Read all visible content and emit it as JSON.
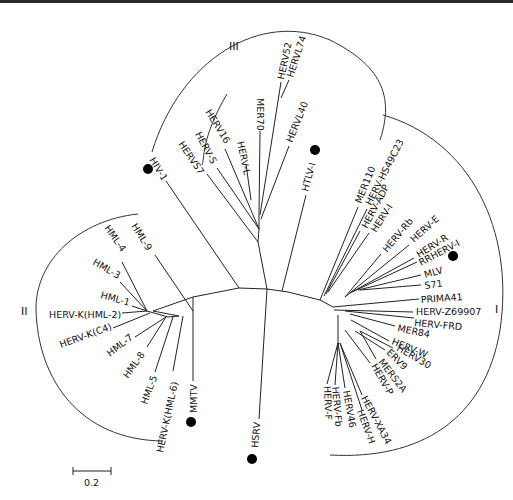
{
  "figure": {
    "type": "unrooted phylogenetic tree",
    "scale_bar": {
      "label": "0.2"
    },
    "clades": [
      {
        "id": "I",
        "label": "I"
      },
      {
        "id": "II",
        "label": "II"
      },
      {
        "id": "III",
        "label": "III"
      }
    ],
    "taxa": {
      "clade_III": [
        "HERV52",
        "HERVL74",
        "MER70",
        "HERVL40",
        "HERV16",
        "HERV-S",
        "HERV-L",
        "HERVS7"
      ],
      "clade_I": [
        "MER110",
        "HERV-HS49C23",
        "HERV-ADP",
        "HERV-I",
        "HERV-Rb",
        "HERV-E",
        "HERV-R",
        "RRHERV-I",
        "MLV",
        "S71",
        "PRIMA41",
        "HERV-Z69907",
        "HERV-FRD",
        "MER84",
        "HERV-W",
        "HERV30",
        "ERV9",
        "MERS2A",
        "HERV-P",
        "HERV-XA34",
        "HERV-H",
        "HERV46",
        "HERV-Fb",
        "HERV-F"
      ],
      "clade_II": [
        "HML-9",
        "HML-4",
        "HML-3",
        "HML-1",
        "HERV-K(HML-2)",
        "HERV-K(C4)",
        "HML-7",
        "HML-8",
        "HML-5",
        "HERV-K(HML-6)",
        "MMTV"
      ],
      "exogenous": [
        "HIV-1",
        "HTLV-I",
        "HSRV"
      ]
    },
    "exogenous_marker": "filled-circle",
    "colors": {
      "line": "#222222",
      "background": "#ffffff",
      "marker": "#000000"
    }
  }
}
